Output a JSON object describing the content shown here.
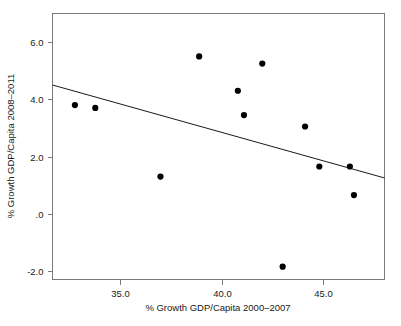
{
  "figure": {
    "background_color": "#ffffff",
    "frame_color": "#7a7a7a",
    "point_color": "#000000",
    "line_color": "#1a1a1a",
    "clipped_header_text": ""
  },
  "chart_data": {
    "type": "scatter",
    "title": "",
    "xlabel": "% Growth GDP/Capita 2000–2007",
    "ylabel": "% Growth GDP/Capita 2008–2011",
    "xlim": [
      31.7,
      48.0
    ],
    "ylim": [
      -2.3,
      7.0
    ],
    "xticks": [
      35.0,
      40.0,
      45.0
    ],
    "xticklabels": [
      "35.0",
      "40.0",
      "45.0"
    ],
    "yticks": [
      6.0,
      4.0,
      2.0,
      0.0,
      -2.0
    ],
    "yticklabels": [
      "6.0",
      "4.0",
      "2.0",
      ".0",
      "-2.0"
    ],
    "grid": false,
    "legend": false,
    "x": [
      32.8,
      33.8,
      37.0,
      38.9,
      40.8,
      41.1,
      42.0,
      43.0,
      44.1,
      44.8,
      46.3,
      46.5
    ],
    "y": [
      3.8,
      3.7,
      1.3,
      5.5,
      4.3,
      3.45,
      5.25,
      -1.85,
      3.05,
      1.65,
      1.65,
      0.65
    ],
    "points": [
      {
        "x": 32.8,
        "y": 3.8
      },
      {
        "x": 33.8,
        "y": 3.7
      },
      {
        "x": 37.0,
        "y": 1.3
      },
      {
        "x": 38.9,
        "y": 5.5
      },
      {
        "x": 40.8,
        "y": 4.3
      },
      {
        "x": 41.1,
        "y": 3.45
      },
      {
        "x": 42.0,
        "y": 5.25
      },
      {
        "x": 43.0,
        "y": -1.85
      },
      {
        "x": 44.1,
        "y": 3.05
      },
      {
        "x": 44.8,
        "y": 1.65
      },
      {
        "x": 46.3,
        "y": 1.65
      },
      {
        "x": 46.5,
        "y": 0.65
      }
    ],
    "fit_line": {
      "x_start": 31.7,
      "y_start": 4.5,
      "x_end": 48.0,
      "y_end": 1.25
    }
  }
}
